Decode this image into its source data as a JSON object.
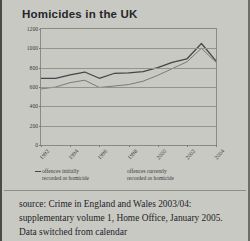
{
  "page": {
    "background_color": "#c9c9c4",
    "text_color": "#232327"
  },
  "figure": {
    "title": "Homicides in the UK",
    "divider": true
  },
  "caption": {
    "text": "source: Crime in England and Wales 2003/04: supplementary volume 1, Home Office, January 2005. Data switched from calendar"
  },
  "legend": {
    "position": "below-axis",
    "entries": [
      {
        "marker": "line-dash",
        "label_line1": "offences initially",
        "label_line2": "recorded as homicide",
        "color": "#45454a"
      },
      {
        "marker": "none",
        "label_line1": "offences currently",
        "label_line2": "recorded as homicide",
        "color": "#6b6b68"
      }
    ]
  },
  "chart_data": {
    "type": "line",
    "title": "Homicides in the UK",
    "xlabel": "",
    "ylabel": "",
    "grid": true,
    "legend_position": "below",
    "ylim": [
      0,
      1200
    ],
    "yticks": [
      0,
      200,
      400,
      600,
      800,
      1000,
      1200
    ],
    "ytick_labels": [
      "0",
      "200",
      "400",
      "600",
      "800",
      "1000",
      "1200"
    ],
    "xticks": [
      1992,
      1994,
      1996,
      1998,
      2000,
      2002,
      2004
    ],
    "xtick_labels": [
      "1992",
      "1994",
      "1996",
      "1998",
      "2000",
      "2002",
      "2004"
    ],
    "x": [
      1992,
      1993,
      1994,
      1995,
      1996,
      1997,
      1998,
      1999,
      2000,
      2001,
      2002,
      2003,
      2004
    ],
    "series": [
      {
        "name": "offences initially recorded as homicide",
        "color": "#45454a",
        "values": [
          690,
          690,
          725,
          755,
          690,
          740,
          745,
          760,
          800,
          855,
          890,
          1050,
          870
        ]
      },
      {
        "name": "offences currently recorded as homicide",
        "color": "#70706d",
        "values": [
          580,
          600,
          645,
          670,
          595,
          610,
          625,
          660,
          720,
          790,
          860,
          1000,
          855
        ]
      }
    ]
  }
}
